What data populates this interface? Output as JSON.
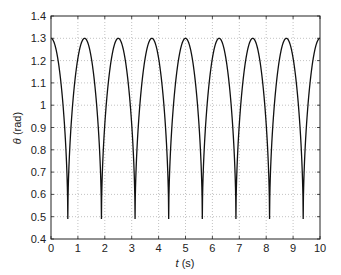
{
  "chart_data": {
    "type": "line",
    "title": "",
    "xlabel_var": "t",
    "xlabel_unit": " (s)",
    "ylabel_var": "θ",
    "ylabel_unit": " (rad)",
    "xlim": [
      0,
      10
    ],
    "ylim": [
      0.4,
      1.4
    ],
    "grid": true,
    "legend": null,
    "xticks": [
      0,
      1,
      2,
      3,
      4,
      5,
      6,
      7,
      8,
      9,
      10
    ],
    "xtick_labels": [
      "0",
      "1",
      "2",
      "3",
      "4",
      "5",
      "6",
      "7",
      "8",
      "9",
      "10"
    ],
    "yticks": [
      0.4,
      0.5,
      0.6,
      0.7,
      0.8,
      0.9,
      1.0,
      1.1,
      1.2,
      1.3,
      1.4
    ],
    "ytick_labels": [
      "0.4",
      "0.5",
      "0.6",
      "0.7",
      "0.8",
      "0.9",
      "1",
      "1.1",
      "1.2",
      "1.3",
      "1.4"
    ],
    "series": [
      {
        "name": "theta",
        "description": "Large-amplitude pendulum oscillation between ~1.30 rad and ~0.49 rad, period ~1.25 s",
        "max": 1.3,
        "min": 0.49,
        "period": 1.25,
        "peaks_t": [
          0,
          1.25,
          2.5,
          3.75,
          5.0,
          6.25,
          7.5,
          8.75,
          10.0
        ],
        "troughs_t": [
          0.62,
          1.87,
          3.12,
          4.37,
          5.62,
          6.87,
          8.12,
          9.37
        ],
        "color": "#111111"
      }
    ]
  }
}
